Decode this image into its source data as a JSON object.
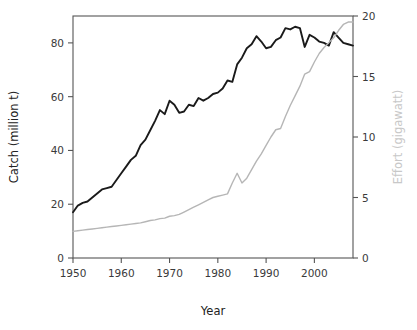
{
  "chart_data": {
    "type": "line",
    "title": "",
    "xlabel": "Year",
    "ylabel": "Catch (million t)",
    "y2label": "Effort (gigawatt)",
    "xlim": [
      1950,
      2008
    ],
    "ylim": [
      0,
      90
    ],
    "y2lim": [
      0,
      20
    ],
    "grid": false,
    "legend": "none",
    "xticks": [
      1950,
      1960,
      1970,
      1980,
      1990,
      2000
    ],
    "xtick_labels": [
      "1950",
      "1960",
      "1970",
      "1980",
      "1990",
      "2000"
    ],
    "yticks": [
      0,
      20,
      40,
      60,
      80
    ],
    "ytick_labels": [
      "0",
      "20",
      "40",
      "60",
      "80"
    ],
    "y2ticks": [
      0,
      5,
      10,
      15,
      20
    ],
    "y2tick_labels": [
      "0",
      "5",
      "10",
      "15",
      "20"
    ],
    "x": [
      1950,
      1951,
      1952,
      1953,
      1954,
      1955,
      1956,
      1957,
      1958,
      1959,
      1960,
      1961,
      1962,
      1963,
      1964,
      1965,
      1966,
      1967,
      1968,
      1969,
      1970,
      1971,
      1972,
      1973,
      1974,
      1975,
      1976,
      1977,
      1978,
      1979,
      1980,
      1981,
      1982,
      1983,
      1984,
      1985,
      1986,
      1987,
      1988,
      1989,
      1990,
      1991,
      1992,
      1993,
      1994,
      1995,
      1996,
      1997,
      1998,
      1999,
      2000,
      2001,
      2002,
      2003,
      2004,
      2005,
      2006,
      2007,
      2008
    ],
    "series": [
      {
        "name": "Catch",
        "axis": "left",
        "color": "#1a1a1a",
        "units": "million t",
        "values": [
          17.0,
          19.5,
          20.5,
          21.0,
          22.5,
          24.0,
          25.5,
          26.0,
          26.5,
          29.0,
          31.5,
          34.0,
          36.5,
          38.0,
          42.0,
          44.0,
          47.5,
          51.0,
          55.0,
          53.5,
          58.5,
          57.0,
          54.0,
          54.5,
          57.0,
          56.5,
          59.5,
          58.5,
          59.5,
          61.0,
          61.5,
          63.0,
          66.0,
          65.5,
          72.0,
          74.5,
          78.0,
          79.5,
          82.5,
          80.5,
          78.0,
          78.5,
          81.0,
          82.0,
          85.5,
          85.0,
          86.0,
          85.5,
          78.5,
          83.0,
          82.0,
          80.5,
          80.0,
          79.0,
          84.0,
          82.0,
          80.0,
          79.5,
          79.0
        ]
      },
      {
        "name": "Effort",
        "axis": "right",
        "color": "#b6b6b6",
        "units": "gigawatt",
        "values": [
          2.2,
          2.25,
          2.3,
          2.35,
          2.4,
          2.45,
          2.5,
          2.55,
          2.6,
          2.65,
          2.7,
          2.75,
          2.8,
          2.85,
          2.9,
          3.0,
          3.1,
          3.15,
          3.25,
          3.3,
          3.45,
          3.5,
          3.6,
          3.8,
          4.0,
          4.2,
          4.4,
          4.6,
          4.8,
          5.0,
          5.1,
          5.2,
          5.3,
          6.2,
          7.0,
          6.2,
          6.6,
          7.3,
          8.0,
          8.6,
          9.3,
          10.0,
          10.6,
          10.7,
          11.7,
          12.6,
          13.4,
          14.2,
          15.2,
          15.4,
          16.2,
          16.9,
          17.4,
          17.8,
          18.2,
          18.8,
          19.3,
          19.5,
          19.5
        ]
      }
    ]
  }
}
